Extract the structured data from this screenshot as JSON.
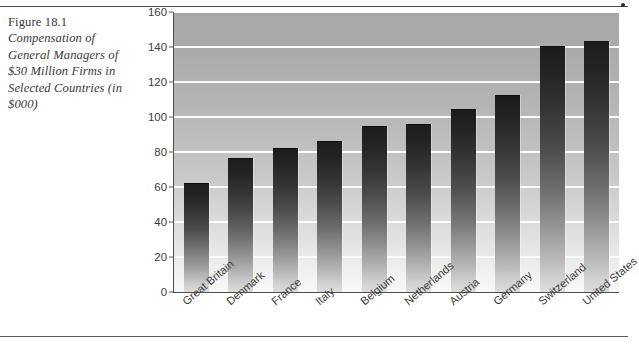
{
  "figure": {
    "number": "Figure 18.1",
    "caption": "Compensation of General Managers of $30 Million Firms in Selected Countries (in $000)"
  },
  "chart_data": {
    "type": "bar",
    "title": "",
    "xlabel": "",
    "ylabel": "",
    "ylim": [
      0,
      160
    ],
    "ytick_step": 20,
    "yticks": [
      "160",
      "140",
      "120",
      "100",
      "80",
      "60",
      "40",
      "20",
      "0"
    ],
    "grid": true,
    "legend": "none",
    "categories": [
      "Great Britain",
      "Denmark",
      "France",
      "Italy",
      "Belgium",
      "Netherlands",
      "Austria",
      "Germany",
      "Switzerland",
      "United States"
    ],
    "values": [
      62,
      76,
      82,
      85.5,
      94.5,
      95.5,
      104,
      112,
      140,
      143
    ],
    "colors": {
      "bar_top": "#1c1c1c",
      "bar_bottom": "#dcdcdc",
      "plot_bg_top": "#a7a7a7",
      "plot_bg_bottom": "#f7f7f7",
      "gridline": "#fdfdfd",
      "axis": "#4f4f4f"
    }
  }
}
